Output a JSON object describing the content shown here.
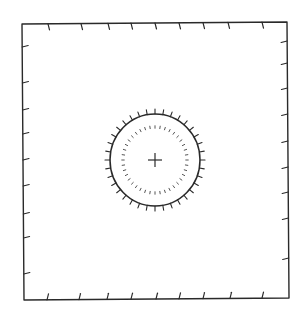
{
  "diagram": {
    "colors": {
      "background": "#ffffff",
      "stroke": "#2a2a2a",
      "dots": "#555555"
    },
    "frame": {
      "corners": {
        "tl": [
          22,
          24
        ],
        "tr": [
          287,
          22
        ],
        "br": [
          289,
          298
        ],
        "bl": [
          24,
          300
        ]
      },
      "ticks_top_x": [
        48,
        81,
        108,
        131,
        155,
        179,
        203,
        228,
        262
      ],
      "ticks_bottom_x": [
        47,
        79,
        107,
        131,
        156,
        179,
        203,
        230,
        262
      ],
      "ticks_left_y": [
        47,
        83,
        110,
        134,
        160,
        186,
        214,
        238,
        274
      ],
      "ticks_right_y": [
        41,
        63,
        88,
        114,
        141,
        167,
        192,
        218,
        258
      ],
      "tick_length": 6
    },
    "circle": {
      "center": [
        155,
        160
      ],
      "radius_x": 45,
      "radius_y": 46,
      "outer_tick_count": 36,
      "outer_tick_length": 5
    },
    "dotted_ring": {
      "radius_x": 32,
      "radius_y": 33,
      "dot_count": 40,
      "dash_length": 2.5
    },
    "center_cross": {
      "half_size": 7
    }
  }
}
